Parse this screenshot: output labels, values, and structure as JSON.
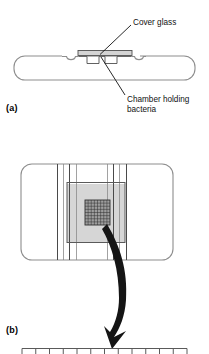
{
  "figure": {
    "type": "scientific-diagram",
    "panels": [
      {
        "id": "a",
        "label": "(a)",
        "view": "cross-section",
        "callouts": [
          {
            "name": "cover-glass",
            "text": "Cover glass"
          },
          {
            "name": "chamber-holding-bacteria",
            "text": "Chamber holding\nbacteria"
          }
        ]
      },
      {
        "id": "b",
        "label": "(b)",
        "view": "top-view",
        "callouts": []
      }
    ]
  },
  "panel_a": {
    "label": "(a)",
    "cover_glass_label": "Cover glass",
    "chamber_label": "Chamber holding\nbacteria",
    "slide": {
      "x": 14,
      "y": 56,
      "width": 181,
      "height": 24,
      "corner_radius": 11,
      "stroke": "#8d8d8d",
      "fill": "#ffffff"
    },
    "cover_glass": {
      "x": 78,
      "y": 50,
      "width": 54,
      "height": 5,
      "fill": "#d9d9d9",
      "stroke": "#555555"
    },
    "chamber_wells": [
      {
        "x": 86,
        "y": 56,
        "width": 12,
        "height": 7
      },
      {
        "x": 104,
        "y": 56,
        "width": 12,
        "height": 7
      }
    ],
    "notches": [
      {
        "cx": 71,
        "cy": 56,
        "r": 5
      },
      {
        "cx": 131,
        "cy": 56,
        "r": 5
      }
    ],
    "leader_lines": [
      {
        "name": "leader-cover-glass",
        "x1": 131,
        "y1": 25,
        "x2": 99,
        "y2": 55
      },
      {
        "name": "leader-chamber",
        "x1": 125,
        "y1": 96,
        "x2": 100,
        "y2": 56
      }
    ]
  },
  "panel_b": {
    "label": "(b)",
    "slide": {
      "x": 21,
      "y": 14,
      "width": 152,
      "height": 96,
      "corner_radius": 11,
      "stroke": "#8d8d8d",
      "fill": "#ffffff"
    },
    "shaded_region": {
      "x": 67,
      "y": 34,
      "width": 58,
      "height": 58,
      "fill": "#d6d6d6"
    },
    "inner_frame": {
      "x": 67,
      "y": 32,
      "width": 58,
      "height": 60,
      "stroke": "#5a5a5a"
    },
    "vertical_rules_x": [
      57,
      63,
      69,
      76,
      107,
      113,
      119,
      126
    ],
    "fine_grid": {
      "x": 85,
      "y": 50,
      "width": 25,
      "height": 25,
      "rows": 8,
      "cols": 8,
      "fill": "#9e9e9e",
      "stroke": "#3a3a3a"
    },
    "arrow": {
      "name": "curved-arrow",
      "fill": "#111111",
      "from": {
        "x": 108,
        "y": 76
      },
      "to": {
        "x": 119,
        "y": 196
      }
    }
  },
  "panel_c_strip": {
    "name": "ruler-strip",
    "visible_portion": "top-edge-only",
    "x": 22,
    "y": 347,
    "width": 165,
    "tick_count": 13,
    "stroke": "#5a5a5a"
  },
  "colors": {
    "ink": "#111111",
    "outline_gray": "#8d8d8d",
    "shade_gray": "#d6d6d6",
    "grid_gray": "#9e9e9e",
    "background": "#ffffff"
  }
}
